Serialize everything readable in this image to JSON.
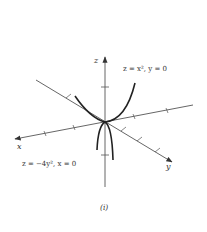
{
  "figure": {
    "caption": "(i)",
    "axes": {
      "x_label": "x",
      "y_label": "y",
      "z_label": "z"
    },
    "curves": [
      {
        "name": "upward-parabola",
        "equation": "z = x², y = 0"
      },
      {
        "name": "downward-parabola",
        "equation": "z = −4y², x = 0"
      }
    ],
    "colors": {
      "axes": "#555555",
      "curves": "#222222",
      "text": "#333333"
    }
  }
}
